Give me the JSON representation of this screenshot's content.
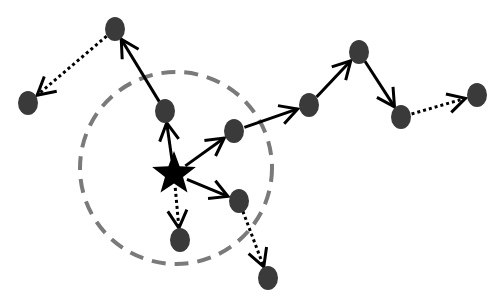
{
  "diagram": {
    "type": "directed-graph",
    "colors": {
      "node": "#3a3a3a",
      "star": "#000000",
      "edge": "#000000",
      "radius_circle": "#7a7a7a",
      "background": "#ffffff"
    },
    "radius_circle": {
      "cx": 176,
      "cy": 168,
      "r": 96,
      "style": "dashed"
    },
    "star": {
      "id": "S",
      "x": 174,
      "y": 174
    },
    "nodes": [
      {
        "id": "A",
        "x": 115,
        "y": 29
      },
      {
        "id": "B",
        "x": 28,
        "y": 103
      },
      {
        "id": "C",
        "x": 165,
        "y": 111
      },
      {
        "id": "D",
        "x": 234,
        "y": 131
      },
      {
        "id": "E",
        "x": 309,
        "y": 105
      },
      {
        "id": "F",
        "x": 359,
        "y": 52
      },
      {
        "id": "G",
        "x": 401,
        "y": 117
      },
      {
        "id": "H",
        "x": 477,
        "y": 95
      },
      {
        "id": "I",
        "x": 239,
        "y": 201
      },
      {
        "id": "J",
        "x": 180,
        "y": 240
      },
      {
        "id": "K",
        "x": 268,
        "y": 278
      }
    ],
    "edges": [
      {
        "from": "S",
        "to": "C",
        "style": "solid"
      },
      {
        "from": "C",
        "to": "A",
        "style": "solid"
      },
      {
        "from": "A",
        "to": "B",
        "style": "dotted"
      },
      {
        "from": "S",
        "to": "D",
        "style": "solid"
      },
      {
        "from": "D",
        "to": "E",
        "style": "solid"
      },
      {
        "from": "E",
        "to": "F",
        "style": "solid"
      },
      {
        "from": "F",
        "to": "G",
        "style": "solid"
      },
      {
        "from": "G",
        "to": "H",
        "style": "dotted"
      },
      {
        "from": "S",
        "to": "I",
        "style": "solid"
      },
      {
        "from": "I",
        "to": "K",
        "style": "dotted"
      },
      {
        "from": "S",
        "to": "J",
        "style": "dotted"
      }
    ]
  }
}
